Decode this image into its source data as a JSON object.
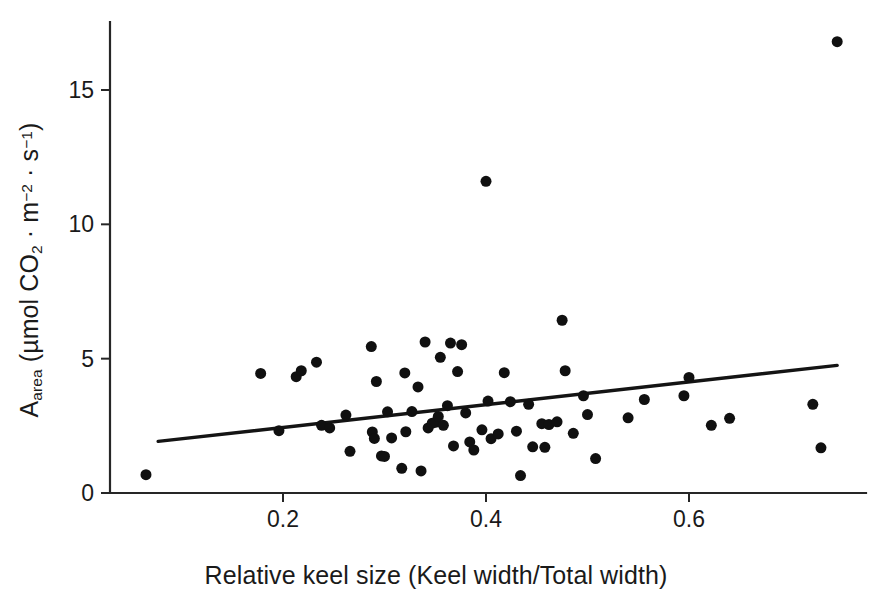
{
  "chart_data": {
    "type": "scatter",
    "title": "",
    "xlabel": "Relative keel size (Keel width/Total width)",
    "ylabel_parts": {
      "symbol": "A",
      "subscript": "area",
      "unit_open": " (µmol CO",
      "unit_co2_sub": "2",
      "unit_mid": " · m",
      "unit_m_sup": "−2",
      "unit_mid2": " · s",
      "unit_s_sup": "−1",
      "unit_close": ")"
    },
    "ylabel_plain": "A_area (µmol CO2 · m−2 · s−1)",
    "xticks": [
      0.2,
      0.4,
      0.6
    ],
    "xtick_labels": [
      "0.2",
      "0.4",
      "0.6"
    ],
    "yticks": [
      0,
      5,
      10,
      15
    ],
    "ytick_labels": [
      "0",
      "5",
      "10",
      "15"
    ],
    "xlim": [
      0.045,
      0.765
    ],
    "ylim": [
      0,
      18.05
    ],
    "grid": false,
    "legend": null,
    "marker_color": "#101010",
    "marker_size_px": 11,
    "line_color": "#141414",
    "axis_color": "#262626",
    "background": "#ffffff",
    "regression_line": {
      "x": [
        0.077,
        0.746
      ],
      "y": [
        1.92,
        4.75
      ]
    },
    "points": [
      {
        "x": 0.065,
        "y": 0.68
      },
      {
        "x": 0.178,
        "y": 4.45
      },
      {
        "x": 0.196,
        "y": 2.32
      },
      {
        "x": 0.213,
        "y": 4.33
      },
      {
        "x": 0.218,
        "y": 4.55
      },
      {
        "x": 0.233,
        "y": 4.87
      },
      {
        "x": 0.238,
        "y": 2.52
      },
      {
        "x": 0.246,
        "y": 2.42
      },
      {
        "x": 0.262,
        "y": 2.9
      },
      {
        "x": 0.266,
        "y": 1.55
      },
      {
        "x": 0.287,
        "y": 5.45
      },
      {
        "x": 0.288,
        "y": 2.27
      },
      {
        "x": 0.29,
        "y": 2.03
      },
      {
        "x": 0.292,
        "y": 4.15
      },
      {
        "x": 0.297,
        "y": 1.38
      },
      {
        "x": 0.3,
        "y": 1.36
      },
      {
        "x": 0.303,
        "y": 3.02
      },
      {
        "x": 0.307,
        "y": 2.05
      },
      {
        "x": 0.317,
        "y": 0.92
      },
      {
        "x": 0.32,
        "y": 4.47
      },
      {
        "x": 0.321,
        "y": 2.28
      },
      {
        "x": 0.327,
        "y": 3.03
      },
      {
        "x": 0.333,
        "y": 3.95
      },
      {
        "x": 0.336,
        "y": 0.82
      },
      {
        "x": 0.34,
        "y": 5.62
      },
      {
        "x": 0.343,
        "y": 2.42
      },
      {
        "x": 0.347,
        "y": 2.6
      },
      {
        "x": 0.35,
        "y": 2.63
      },
      {
        "x": 0.353,
        "y": 2.85
      },
      {
        "x": 0.355,
        "y": 5.05
      },
      {
        "x": 0.358,
        "y": 2.52
      },
      {
        "x": 0.362,
        "y": 3.25
      },
      {
        "x": 0.365,
        "y": 5.58
      },
      {
        "x": 0.368,
        "y": 1.75
      },
      {
        "x": 0.372,
        "y": 4.52
      },
      {
        "x": 0.376,
        "y": 5.52
      },
      {
        "x": 0.38,
        "y": 2.98
      },
      {
        "x": 0.384,
        "y": 1.9
      },
      {
        "x": 0.388,
        "y": 1.6
      },
      {
        "x": 0.396,
        "y": 2.35
      },
      {
        "x": 0.4,
        "y": 11.6
      },
      {
        "x": 0.402,
        "y": 3.42
      },
      {
        "x": 0.405,
        "y": 2.02
      },
      {
        "x": 0.412,
        "y": 2.2
      },
      {
        "x": 0.418,
        "y": 4.48
      },
      {
        "x": 0.424,
        "y": 3.4
      },
      {
        "x": 0.43,
        "y": 2.3
      },
      {
        "x": 0.434,
        "y": 0.65
      },
      {
        "x": 0.442,
        "y": 3.3
      },
      {
        "x": 0.446,
        "y": 1.72
      },
      {
        "x": 0.455,
        "y": 2.58
      },
      {
        "x": 0.458,
        "y": 1.7
      },
      {
        "x": 0.462,
        "y": 2.55
      },
      {
        "x": 0.47,
        "y": 2.65
      },
      {
        "x": 0.475,
        "y": 6.43
      },
      {
        "x": 0.478,
        "y": 4.55
      },
      {
        "x": 0.486,
        "y": 2.22
      },
      {
        "x": 0.496,
        "y": 3.62
      },
      {
        "x": 0.5,
        "y": 2.92
      },
      {
        "x": 0.508,
        "y": 1.28
      },
      {
        "x": 0.54,
        "y": 2.8
      },
      {
        "x": 0.556,
        "y": 3.48
      },
      {
        "x": 0.595,
        "y": 3.62
      },
      {
        "x": 0.6,
        "y": 4.3
      },
      {
        "x": 0.622,
        "y": 2.52
      },
      {
        "x": 0.64,
        "y": 2.78
      },
      {
        "x": 0.722,
        "y": 3.3
      },
      {
        "x": 0.73,
        "y": 1.68
      },
      {
        "x": 0.746,
        "y": 16.8
      }
    ]
  },
  "figure": {
    "axis_origin_px": {
      "x": 110,
      "y": 493
    },
    "x_pixel_for": {
      "0.2": 283,
      "0.4": 486,
      "0.6": 689
    },
    "y_pixel_for": {
      "0": 493,
      "5": 357,
      "10": 223,
      "15": 90
    }
  }
}
